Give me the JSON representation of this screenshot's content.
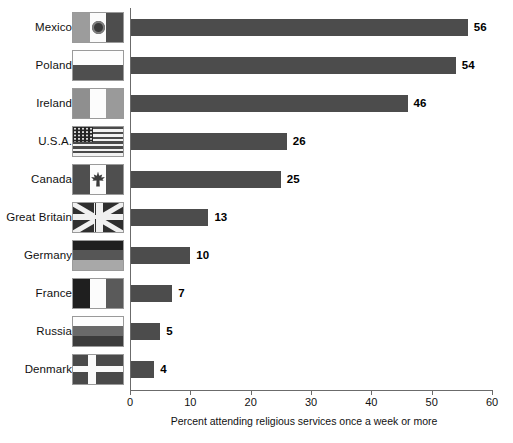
{
  "chart_data": {
    "type": "bar",
    "orientation": "horizontal",
    "title": "",
    "xlabel": "Percent attending religious services once a week or more",
    "ylabel": "",
    "categories": [
      "Mexico",
      "Poland",
      "Ireland",
      "U.S.A.",
      "Canada",
      "Great Britain",
      "Germany",
      "France",
      "Russia",
      "Denmark"
    ],
    "values": [
      56,
      54,
      46,
      26,
      25,
      13,
      10,
      7,
      5,
      4
    ],
    "xlim": [
      0,
      60
    ],
    "xticks": [
      0,
      10,
      20,
      30,
      40,
      50,
      60
    ],
    "xtick_labels": [
      "0",
      "10",
      "20",
      "30",
      "40",
      "50",
      "60"
    ],
    "grid": false,
    "legend": "none",
    "bar_color": "#4c4c4c",
    "value_labels_shown": true
  },
  "rows": [
    {
      "country": "Mexico",
      "value": 56,
      "value_label": "56",
      "flag": "flag-mexico"
    },
    {
      "country": "Poland",
      "value": 54,
      "value_label": "54",
      "flag": "flag-poland"
    },
    {
      "country": "Ireland",
      "value": 46,
      "value_label": "46",
      "flag": "flag-ireland"
    },
    {
      "country": "U.S.A.",
      "value": 26,
      "value_label": "26",
      "flag": "flag-usa"
    },
    {
      "country": "Canada",
      "value": 25,
      "value_label": "25",
      "flag": "flag-canada"
    },
    {
      "country": "Great Britain",
      "value": 13,
      "value_label": "13",
      "flag": "flag-great-britain"
    },
    {
      "country": "Germany",
      "value": 10,
      "value_label": "10",
      "flag": "flag-germany"
    },
    {
      "country": "France",
      "value": 7,
      "value_label": "7",
      "flag": "flag-france"
    },
    {
      "country": "Russia",
      "value": 5,
      "value_label": "5",
      "flag": "flag-russia"
    },
    {
      "country": "Denmark",
      "value": 4,
      "value_label": "4",
      "flag": "flag-denmark"
    }
  ],
  "axis": {
    "title": "Percent attending religious services once a week or more",
    "ticks": [
      "0",
      "10",
      "20",
      "30",
      "40",
      "50",
      "60"
    ]
  },
  "colors": {
    "bar": "#4c4c4c",
    "axis": "#6b6b6b",
    "text": "#111111",
    "background": "#ffffff"
  }
}
